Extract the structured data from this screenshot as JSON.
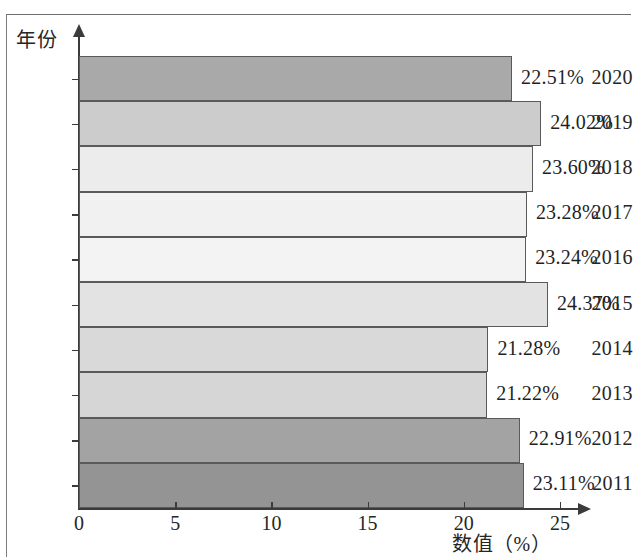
{
  "chart_data": {
    "type": "bar",
    "orientation": "horizontal",
    "title": "",
    "xlabel": "数值（%）",
    "ylabel": "年份",
    "categories": [
      "2020",
      "2019",
      "2018",
      "2017",
      "2016",
      "2015",
      "2014",
      "2013",
      "2012",
      "2011"
    ],
    "values": [
      22.51,
      24.02,
      23.6,
      23.28,
      23.24,
      24.37,
      21.28,
      21.22,
      22.91,
      23.11
    ],
    "value_labels": [
      "22.51%",
      "24.02%",
      "23.60%",
      "23.28%",
      "23.24%",
      "24.37%",
      "21.28%",
      "21.22%",
      "22.91%",
      "23.11%"
    ],
    "bar_colors": [
      "#a9a9a9",
      "#cccccc",
      "#ececec",
      "#f1f1f1",
      "#f3f3f3",
      "#e3e3e3",
      "#d9d9d9",
      "#d6d6d6",
      "#a3a3a3",
      "#949494"
    ],
    "xlim": [
      0,
      26.2
    ],
    "xticks": [
      0,
      5,
      10,
      15,
      20,
      25
    ],
    "xtick_labels": [
      "0",
      "5",
      "10",
      "15",
      "20",
      "25"
    ],
    "grid": false,
    "legend": null
  },
  "axes": {
    "y_title": "年份",
    "x_title": "数值（%）"
  }
}
